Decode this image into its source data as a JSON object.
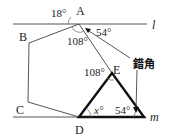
{
  "figure": {
    "lines": {
      "l": {
        "label": "l"
      },
      "m": {
        "label": "m"
      }
    },
    "points": {
      "A": "A",
      "B": "B",
      "C": "C",
      "D": "D",
      "E": "E"
    },
    "angles": {
      "top_left_at_A": "18°",
      "interior_at_A": "108°",
      "right_at_A": "54°",
      "at_E": "108°",
      "at_D": "x°",
      "bottom_right": "54°"
    },
    "annotation": "錯角",
    "colors": {
      "thin_line": "#555555",
      "thick_line": "#111111"
    }
  }
}
